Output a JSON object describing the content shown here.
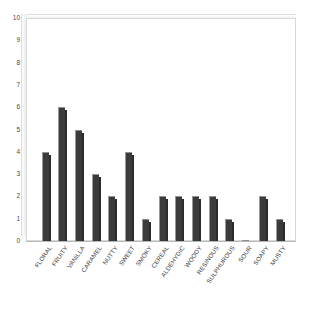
{
  "chart_data": {
    "type": "bar",
    "title": "",
    "subtitle": "",
    "xlabel": "",
    "ylabel": "",
    "categories": [
      "FLORAL",
      "FRUITY",
      "VANILLA",
      "CARAMEL",
      "NUTTY",
      "SWEET",
      "SMOKY",
      "CEREAL",
      "ALDEHYDIC",
      "WOODY",
      "RESINOUS",
      "SULPHUROUS",
      "SOUR",
      "SOAPY",
      "MUSTY"
    ],
    "values": [
      4,
      6,
      5,
      3,
      2,
      4,
      1,
      2,
      2,
      2,
      2,
      1,
      0,
      2,
      1
    ],
    "ylim": [
      0,
      10
    ],
    "ytick_labels": [
      "0",
      "1",
      "2",
      "3",
      "4",
      "5",
      "6",
      "7",
      "8",
      "9",
      "10"
    ],
    "ytick_values": [
      0,
      1,
      2,
      3,
      4,
      5,
      6,
      7,
      8,
      9,
      10
    ],
    "grid": false,
    "legend": null,
    "legend_position": "none",
    "bar_color": "#3b3b3b",
    "bar_edge_color": "#9a9a9a",
    "plot_background": "#ffffff",
    "frame_color": "#d8d8d8",
    "axis_text_color": "#3a3a3a"
  }
}
